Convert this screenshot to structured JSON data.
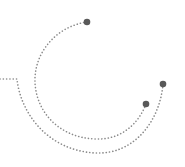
{
  "graphic": {
    "description": "decorative dotted arcs with endpoint dots",
    "colors": {
      "line": "#8a8a8a",
      "dot": "#595959",
      "background": "#ffffff"
    },
    "inner_arc": {
      "start": [
        87,
        22
      ],
      "end": [
        146,
        104
      ]
    },
    "outer_arc": {
      "start": [
        0,
        79
      ],
      "corner": [
        17,
        79
      ],
      "end": [
        163,
        84
      ]
    }
  }
}
